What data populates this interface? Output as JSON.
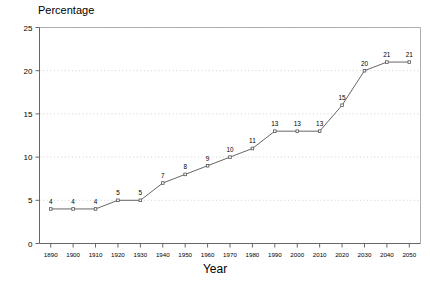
{
  "chart_data": {
    "type": "line",
    "title": "Percentage",
    "xlabel": "Year",
    "ylabel": "Percentage",
    "categories": [
      1890,
      1900,
      1910,
      1920,
      1930,
      1940,
      1950,
      1960,
      1970,
      1980,
      1990,
      2000,
      2010,
      2020,
      2030,
      2040,
      2050
    ],
    "x_tick_labels": [
      "1890",
      "1900",
      "1910",
      "1920",
      "1930",
      "1940",
      "1950",
      "1960",
      "1970",
      "1980",
      "1990",
      "2000",
      "2010",
      "2020",
      "2030",
      "2040",
      "2050"
    ],
    "values": [
      4,
      4,
      4,
      5,
      5,
      7,
      8,
      9,
      10,
      11,
      13,
      13,
      13,
      16,
      20,
      21,
      21
    ],
    "point_labels": [
      "4",
      "4",
      "4",
      "5",
      "5",
      "7",
      "8",
      "9",
      "10",
      "11",
      "13",
      "13",
      "13",
      "15",
      "20",
      "21",
      "21"
    ],
    "y_tick_labels": [
      "0",
      "5",
      "10",
      "15",
      "20",
      "25"
    ],
    "y_ticks": [
      0,
      5,
      10,
      15,
      20,
      25
    ],
    "ylim": [
      0,
      25
    ],
    "xlim": [
      1885,
      2055
    ],
    "grid": "horizontal-dotted",
    "legend": "none",
    "marker": "open-square",
    "line_color": "#555555",
    "grid_color": "#bbbbbb",
    "axis_color": "#666666",
    "series_name": "Percentage"
  },
  "axes": {
    "title_text": "Percentage",
    "x_axis_title": "Year"
  }
}
